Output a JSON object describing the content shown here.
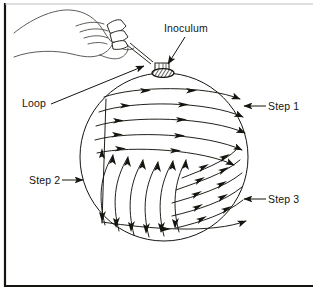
{
  "figure": {
    "background_color": "#ffffff",
    "ink_color": "#15140f",
    "frame": {
      "name": "figure-border",
      "left_x": 5,
      "top_y": 3,
      "bottom_y": 286,
      "right_x": 313,
      "stroke_width": 2.2
    }
  },
  "plate": {
    "name": "agar-plate-circle",
    "center_x": 164,
    "center_y": 157,
    "radius": 84,
    "stroke_width": 1.0
  },
  "inoculum": {
    "name": "inoculum-spot",
    "center_x": 163,
    "center_y": 73,
    "rx": 11,
    "ry": 4.4,
    "hatched": true
  },
  "labels": [
    {
      "id": "inoculum",
      "text": "Inoculum",
      "x": 164,
      "y": 32,
      "anchor": "start",
      "leader": {
        "x1": 185,
        "y1": 36,
        "x2": 168,
        "y2": 66
      },
      "arrow": true,
      "arrow_dir": "down"
    },
    {
      "id": "loop",
      "text": "Loop",
      "x": 22,
      "y": 107,
      "anchor": "start",
      "leader": {
        "x1": 51,
        "y1": 103,
        "x2": 146,
        "y2": 66
      },
      "arrow": true,
      "arrow_dir": "up-right"
    },
    {
      "id": "step1",
      "text": "Step 1",
      "x": 268,
      "y": 110,
      "anchor": "start",
      "leader": {
        "x1": 264,
        "y1": 106,
        "x2": 243,
        "y2": 106
      },
      "arrow": true,
      "arrow_dir": "left"
    },
    {
      "id": "step2",
      "text": "Step 2",
      "x": 29,
      "y": 184,
      "anchor": "start",
      "leader": {
        "x1": 63,
        "y1": 180,
        "x2": 82,
        "y2": 180
      },
      "arrow": true,
      "arrow_dir": "right"
    },
    {
      "id": "step3",
      "text": "Step 3",
      "x": 268,
      "y": 203,
      "anchor": "start",
      "leader": {
        "x1": 264,
        "y1": 199,
        "x2": 243,
        "y2": 199
      },
      "arrow": true,
      "arrow_dir": "left"
    }
  ],
  "streaks": {
    "step1": {
      "name": "step1-streaks",
      "count": 5,
      "direction": "horizontal-arcs-left-to-right",
      "paths": [
        "M 104,97 C 135,86 205,85 240,99",
        "M 99,112 C 133,100 208,101 243,117",
        "M 96,126 C 131,115 210,117 245,133",
        "M 95,140 C 130,130 208,134 242,150",
        "M 97,153 C 132,145 203,150 234,165"
      ],
      "arrow_positions": [
        0.33,
        0.63,
        0.9
      ]
    },
    "step2": {
      "name": "step2-streaks",
      "count": 6,
      "direction": "vertical-curved-up-down",
      "paths": [
        "M 105,225 C 98,198 100,176 113,155",
        "M 119,231 C 112,204 114,180 128,157",
        "M 134,235 C 127,208 129,183 143,160",
        "M 149,237 C 142,210 144,185 158,162",
        "M 164,236 C 157,209 159,184 173,161",
        "M 179,232 C 172,206 174,182 186,160"
      ],
      "arrow_positions": [
        0.18,
        0.55,
        0.9
      ]
    },
    "step3": {
      "name": "step3-streaks",
      "count": 5,
      "direction": "diagonal-arcs-lower-left-to-upper-right",
      "paths": [
        "M 182,178 C 202,170 224,162 236,150",
        "M 176,190 C 198,182 224,174 240,160",
        "M 172,203 C 196,196 224,188 242,173",
        "M 172,216 C 197,210 224,202 242,187",
        "M 176,228 C 201,222 226,214 243,200"
      ],
      "arrow_positions": [
        0.3,
        0.62,
        0.92
      ]
    },
    "connector": {
      "name": "streak-connector-line",
      "paths": [
        "M 106,100 L 102,224",
        "M 103,222 C 150,228 212,234 246,222"
      ]
    }
  },
  "hand": {
    "name": "hand-holding-loop",
    "outline_paths": [
      "M 14,33 C 30,20 52,9 70,10 C 86,11 96,19 103,30 C 108,38 112,44 118,47",
      "M 118,47 C 124,50 130,51 134,48",
      "M 14,57 C 32,50 56,50 72,54 C 84,57 92,58 100,55",
      "M 100,55 C 106,53 110,49 112,45",
      "M 100,55 C 107,58 114,60 120,58 C 125,56 128,52 128,48",
      "M 112,45 C 116,41 120,37 124,35",
      "M 76,26 C 86,22 96,21 104,24",
      "M 80,33 C 90,29 100,29 108,32",
      "M 84,39 C 93,36 101,36 108,39"
    ],
    "finger_paths": [
      "M 108,26 C 113,22 118,20 122,21 L 126,26 C 122,30 116,33 111,33 Z",
      "M 110,34 C 115,31 120,30 124,31 L 127,36 C 123,40 117,42 112,41 Z",
      "M 112,42 C 117,40 122,39 125,40 L 127,45 C 123,48 117,49 113,48 Z"
    ],
    "loop_handle": "M 127,44 L 152,65",
    "loop_ring": {
      "cx": 162,
      "cy": 67,
      "rx": 5.5,
      "ry": 3.4
    }
  }
}
